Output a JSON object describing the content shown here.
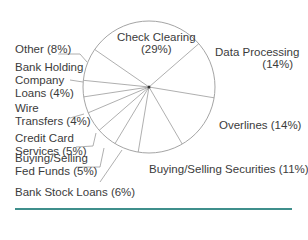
{
  "chart_data": {
    "type": "pie",
    "title": "",
    "start_angle_deg": -145.4,
    "direction": "clockwise",
    "slices": [
      {
        "label": "Check Clearing",
        "value": 29
      },
      {
        "label": "Data Processing",
        "value": 14
      },
      {
        "label": "Overlines",
        "value": 14
      },
      {
        "label": "Buying/Selling Securities",
        "value": 11
      },
      {
        "label": "Bank Stock Loans",
        "value": 6
      },
      {
        "label": "Buying/Selling Fed Funds",
        "value": 5
      },
      {
        "label": "Credit Card Services",
        "value": 5
      },
      {
        "label": "Wire Transfers",
        "value": 4
      },
      {
        "label": "Bank Holding Company Loans",
        "value": 4
      },
      {
        "label": "Other",
        "value": 8
      }
    ],
    "legend": "none",
    "grid": false
  },
  "labels": {
    "check_clearing": [
      "Check Clearing",
      "(29%)"
    ],
    "data_processing": [
      "Data Processing",
      "(14%)"
    ],
    "overlines": [
      "Overlines (14%)"
    ],
    "securities": [
      "Buying/Selling Securities (11%)"
    ],
    "bank_stock": [
      "Bank Stock Loans (6%)"
    ],
    "fed_funds": [
      "Buying/Selling",
      "Fed Funds (5%)"
    ],
    "credit_card": [
      "Credit Card",
      "Services (5%)"
    ],
    "wire": [
      "Wire",
      "Transfers (4%)"
    ],
    "bhc": [
      "Bank Holding",
      "Company",
      "Loans (4%)"
    ],
    "other": [
      "Other (8%)"
    ]
  },
  "colors": {
    "line": "#9a9a9a",
    "text": "#3b3b3b",
    "rule": "#3f8f8c"
  }
}
